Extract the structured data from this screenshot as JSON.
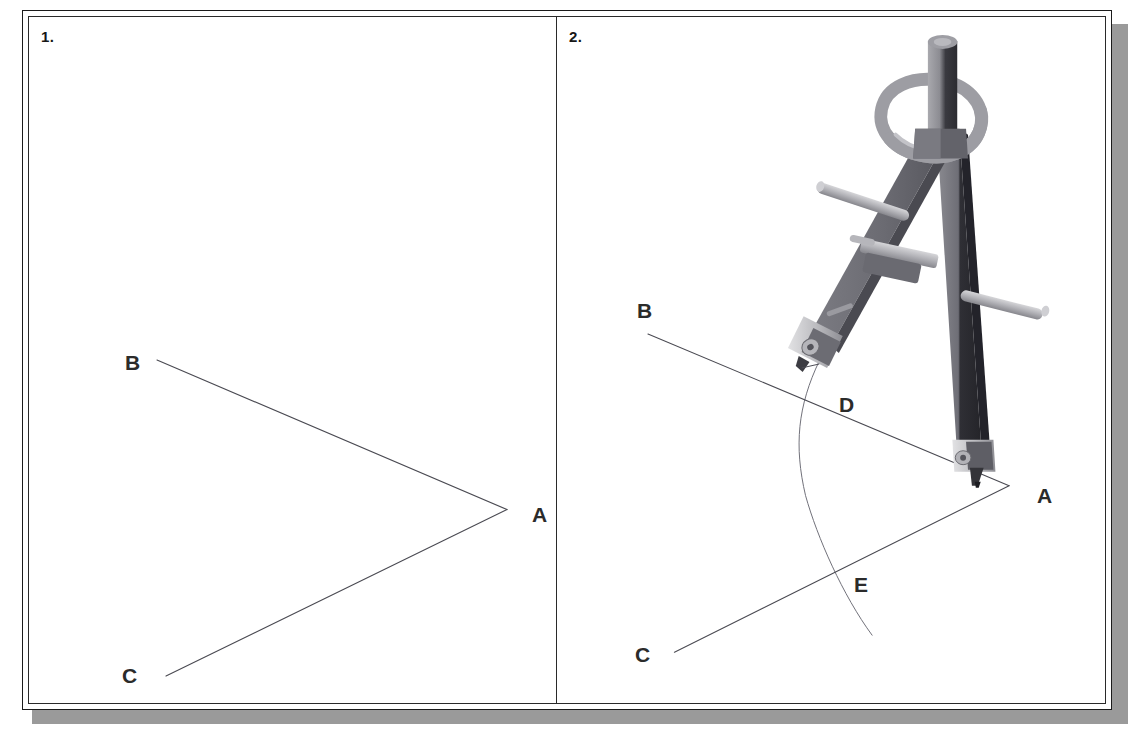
{
  "document": {
    "title": "Constructing an angle bisector — steps 1 and 2",
    "background_color": "#ffffff",
    "card_border_color": "#1b1b1b",
    "card_shadow_color": "#9a9a9a"
  },
  "panels": [
    {
      "number": "1.",
      "name": "panel-given-angle",
      "caption": "",
      "labels": [
        {
          "text": "B",
          "x": 96,
          "y": 335
        },
        {
          "text": "A",
          "x": 503,
          "y": 487
        },
        {
          "text": "C",
          "x": 93,
          "y": 648
        }
      ],
      "geometry": {
        "vertex": {
          "name": "A",
          "x": 478,
          "y": 494
        },
        "rays": [
          {
            "name": "ray-AB",
            "from": [
              478,
              494
            ],
            "to": [
              128,
              344
            ]
          },
          {
            "name": "ray-AC",
            "from": [
              478,
              494
            ],
            "to": [
              137,
              661
            ]
          }
        ],
        "arc": null,
        "line_color": "#4a4a52",
        "line_width": 1
      }
    },
    {
      "number": "2.",
      "name": "panel-arc-construction",
      "caption": "",
      "labels": [
        {
          "text": "B",
          "x": 80,
          "y": 283
        },
        {
          "text": "D",
          "x": 282,
          "y": 377
        },
        {
          "text": "A",
          "x": 480,
          "y": 468
        },
        {
          "text": "E",
          "x": 297,
          "y": 557
        },
        {
          "text": "C",
          "x": 78,
          "y": 627
        }
      ],
      "geometry": {
        "vertex": {
          "name": "A",
          "x": 462,
          "y": 470
        },
        "rays": [
          {
            "name": "ray-AB",
            "from": [
              462,
              470
            ],
            "to": [
              93,
              318
            ]
          },
          {
            "name": "ray-AC",
            "from": [
              462,
              470
            ],
            "to": [
              120,
              637
            ]
          }
        ],
        "arc": {
          "name": "construction-arc",
          "center": [
            462,
            470
          ],
          "radius": 200,
          "start": [
            268,
            345
          ],
          "through": [
            254,
            470
          ],
          "end": [
            322,
            620
          ],
          "color": "#6f6f78",
          "width": 1
        },
        "intersections": [
          {
            "name": "D",
            "x": 272,
            "y": 389,
            "on": "ray-AB"
          },
          {
            "name": "E",
            "x": 281,
            "y": 568,
            "on": "ray-AC"
          }
        ],
        "line_color": "#4a4a52",
        "line_width": 1
      },
      "tool": {
        "name": "compass",
        "needle_point_at": "A",
        "pencil_point_at": "D",
        "colors": {
          "leg_light": "#8d8d93",
          "leg_mid": "#6e6e75",
          "leg_dark": "#3b3b41",
          "metal": "#b9b9bd",
          "metal_light": "#d2d2d5",
          "metal_shadow": "#8a8a90"
        }
      }
    }
  ]
}
